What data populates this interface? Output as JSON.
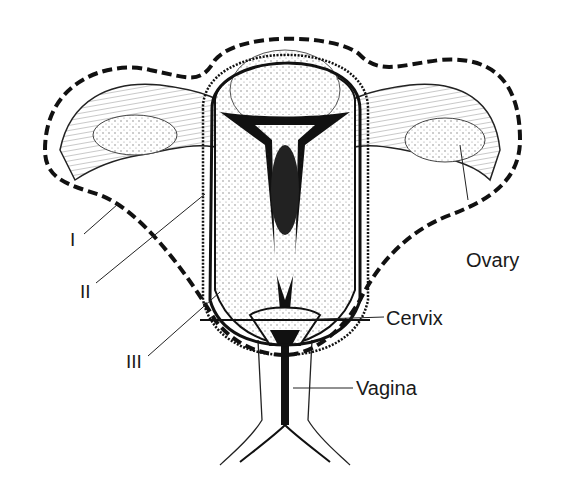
{
  "figure": {
    "type": "anatomical diagram"
  },
  "labels": {
    "ovary": "Ovary",
    "cervix": "Cervix",
    "vagina": "Vagina",
    "line_1": "I",
    "line_2": "II",
    "line_3": "III"
  },
  "colors": {
    "ink": "#111111",
    "background": "#ffffff",
    "stipple": "#9a9a9a"
  }
}
